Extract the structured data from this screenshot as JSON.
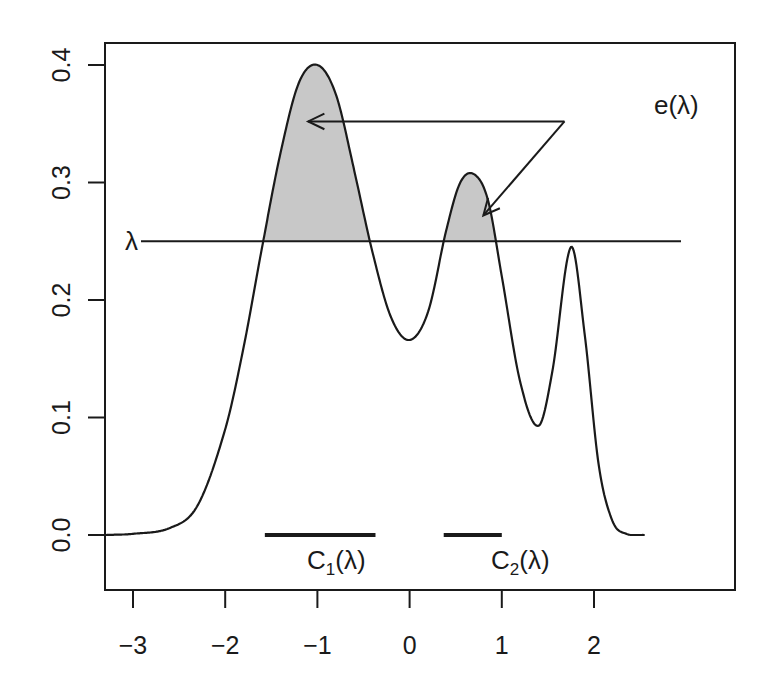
{
  "chart_data": {
    "type": "line",
    "title": "",
    "xlabel": "",
    "ylabel": "",
    "xlim": [
      -3.3,
      2.55
    ],
    "ylim": [
      -0.048,
      0.417
    ],
    "grid": false,
    "x_ticks": [
      -3,
      -2,
      -1,
      0,
      1,
      2
    ],
    "x_tick_labels": [
      "−3",
      "−2",
      "−1",
      "0",
      "1",
      "2"
    ],
    "y_ticks": [
      0.0,
      0.1,
      0.2,
      0.3,
      0.4
    ],
    "y_tick_labels": [
      "0.0",
      "0.1",
      "0.2",
      "0.3",
      "0.4"
    ],
    "series": [
      {
        "name": "density",
        "x": [
          -3.3,
          -3.0,
          -2.6,
          -2.3,
          -2.0,
          -1.8,
          -1.6,
          -1.4,
          -1.2,
          -1.0,
          -0.8,
          -0.6,
          -0.4,
          -0.2,
          0.0,
          0.2,
          0.4,
          0.55,
          0.7,
          0.85,
          1.0,
          1.2,
          1.4,
          1.55,
          1.75,
          1.9,
          2.05,
          2.2,
          2.35,
          2.55
        ],
        "y": [
          0.0,
          0.001,
          0.006,
          0.025,
          0.09,
          0.16,
          0.245,
          0.325,
          0.385,
          0.4,
          0.375,
          0.31,
          0.24,
          0.185,
          0.166,
          0.19,
          0.26,
          0.3,
          0.307,
          0.285,
          0.22,
          0.13,
          0.093,
          0.14,
          0.245,
          0.17,
          0.06,
          0.012,
          0.001,
          0.0
        ]
      }
    ],
    "threshold": {
      "label": "λ",
      "value": 0.25,
      "x_from": -3.0,
      "x_to": 2.1
    },
    "shaded_regions": [
      {
        "name": "e(λ) region 1",
        "x_from": -1.57,
        "x_to": -0.37,
        "fill": "#c8c8c8"
      },
      {
        "name": "e(λ) region 2",
        "x_from": 0.37,
        "x_to": 1.0,
        "fill": "#c8c8c8"
      }
    ],
    "segments": [
      {
        "label_main": "C",
        "label_sub": "1",
        "label_suffix": "(λ)",
        "x_from": -1.57,
        "x_to": -0.37,
        "y": 0.0
      },
      {
        "label_main": "C",
        "label_sub": "2",
        "label_suffix": "(λ)",
        "x_from": 0.37,
        "x_to": 1.0,
        "y": 0.0
      }
    ],
    "annotations": [
      {
        "text": "e(λ)",
        "x": 1.85,
        "y": 0.36
      }
    ],
    "arrows": [
      {
        "from": [
          1.68,
          0.352
        ],
        "to": [
          -1.1,
          0.352
        ]
      },
      {
        "from": [
          1.68,
          0.352
        ],
        "to": [
          0.8,
          0.272
        ]
      }
    ]
  },
  "labels": {
    "lambda": "λ",
    "e_lambda": "e(λ)",
    "c1_main": "C",
    "c1_sub": "1",
    "c1_suffix": "(λ)",
    "c2_main": "C",
    "c2_sub": "2",
    "c2_suffix": "(λ)"
  },
  "colors": {
    "line": "#1a1a1a",
    "fill": "#c8c8c8",
    "background": "#ffffff"
  }
}
